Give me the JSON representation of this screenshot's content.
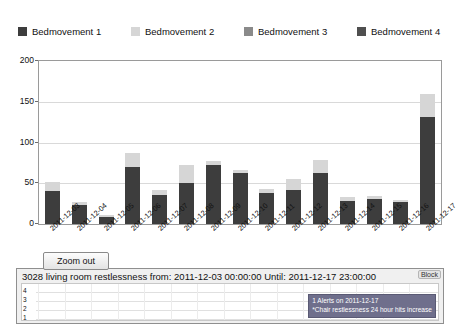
{
  "chart_data": {
    "type": "bar",
    "title": "",
    "xlabel": "",
    "ylabel": "",
    "ylim": [
      0,
      200
    ],
    "yticks": [
      0,
      50,
      100,
      150,
      200
    ],
    "grid": true,
    "stacked": true,
    "legend_position": "top",
    "categories": [
      "2011-12-03",
      "2011-12-04",
      "2011-12-05",
      "2011-12-06",
      "2011-12-07",
      "2011-12-08",
      "2011-12-09",
      "2011-12-10",
      "2011-12-11",
      "2011-12-12",
      "2011-12-13",
      "2011-12-14",
      "2011-12-15",
      "2011-12-16",
      "2011-12-17"
    ],
    "series": [
      {
        "name": "Bedmovement 1",
        "color": "#3d3d3d",
        "values": [
          40,
          23,
          9,
          70,
          35,
          50,
          73,
          63,
          38,
          42,
          63,
          28,
          31,
          27,
          131
        ]
      },
      {
        "name": "Bedmovement 2",
        "color": "#d6d6d6",
        "values": [
          12,
          4,
          2,
          17,
          7,
          22,
          4,
          3,
          5,
          13,
          16,
          5,
          4,
          3,
          29
        ]
      },
      {
        "name": "Bedmovement 3",
        "color": "#8a8a8a",
        "values": [
          0,
          0,
          0,
          0,
          0,
          0,
          0,
          0,
          0,
          0,
          0,
          0,
          0,
          0,
          0
        ]
      },
      {
        "name": "Bedmovement 4",
        "color": "#4f4f4f",
        "values": [
          0,
          0,
          0,
          0,
          0,
          0,
          0,
          0,
          0,
          0,
          0,
          0,
          0,
          0,
          0
        ]
      }
    ]
  },
  "legend": {
    "items": [
      {
        "label": "Bedmovement 1",
        "color": "#3d3d3d"
      },
      {
        "label": "Bedmovement 2",
        "color": "#d6d6d6"
      },
      {
        "label": "Bedmovement 3",
        "color": "#8a8a8a"
      },
      {
        "label": "Bedmovement 4",
        "color": "#4f4f4f"
      }
    ]
  },
  "controls": {
    "zoom_out_label": "Zoom out",
    "block_tab_label": "Block"
  },
  "lower_panel": {
    "title": "3028 living room restlessness from: 2011-12-03 00:00:00 Until: 2011-12-17 23:00:00",
    "yticks": [
      "4",
      "3",
      "2",
      "1"
    ],
    "tooltip": {
      "line1": "1 Alerts on 2011-12-17",
      "line2": "*Chair restlessness 24 hour hits increase"
    }
  }
}
